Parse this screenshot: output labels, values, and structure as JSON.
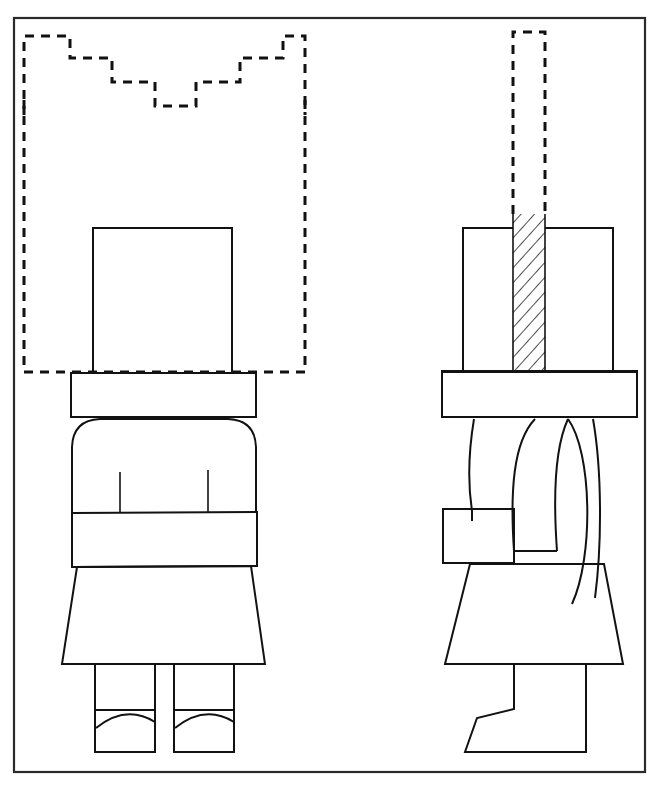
{
  "page": {
    "background_color": "#ffffff",
    "ink_color": "#121212",
    "caption_partial_top": "U.S. Patent",
    "width": 656,
    "height": 789
  },
  "frame": {
    "name": "drawing-border",
    "x": 14,
    "y": 18,
    "width": 631,
    "height": 754,
    "stroke": "#2a2a2a"
  },
  "figure": {
    "type": "line-drawing",
    "views": [
      {
        "id": "front-view",
        "label": "front elevation",
        "side": "left"
      },
      {
        "id": "side-view",
        "label": "side elevation",
        "side": "right"
      }
    ]
  },
  "front_view": {
    "name": "front-elevation",
    "crown_phantom": {
      "name": "crown-phantom-outline",
      "style": "dashed",
      "points": "24,115 24,36 70,36 70,58 112,58 112,82 155,82 155,106 196,106 196,82 240,82 240,58 283,58 283,36 305,36 305,115"
    },
    "crown_baseline": {
      "name": "crown-baseline",
      "style": "dashed",
      "x1": 24,
      "y1": 372,
      "x2": 305,
      "y2": 372
    },
    "crown_left_rail": {
      "x": 24,
      "y1": 100,
      "y2": 372
    },
    "crown_right_rail": {
      "x": 305,
      "y1": 100,
      "y2": 372
    },
    "head": {
      "name": "head-block",
      "x": 93,
      "y": 228,
      "width": 139,
      "height": 145
    },
    "brim": {
      "name": "hat-brim",
      "x": 71,
      "y": 373,
      "width": 185,
      "height": 44
    },
    "torso": {
      "name": "torso",
      "left": 72,
      "right": 256,
      "top": 420,
      "bottom": 512,
      "shoulder_radius": 26
    },
    "arm_line_left": {
      "x": 120,
      "y1": 472,
      "y2": 512
    },
    "arm_line_right": {
      "x": 208,
      "y1": 470,
      "y2": 512
    },
    "belt": {
      "name": "belt-band",
      "x": 72,
      "y": 512,
      "width": 185,
      "height": 54
    },
    "skirt": {
      "name": "skirt-trapezoid",
      "points": "77,566 251,566 265,664 62,664"
    },
    "leg_left": {
      "name": "leg-left",
      "x": 95,
      "y": 666,
      "width": 60,
      "height": 84
    },
    "leg_right": {
      "name": "leg-right",
      "x": 174,
      "y": 666,
      "width": 60,
      "height": 84
    },
    "shoe_line_left": {
      "x1": 95,
      "y1": 710,
      "x2": 155,
      "y2": 710
    },
    "shoe_line_right": {
      "x1": 174,
      "y1": 710,
      "x2": 234,
      "y2": 710
    },
    "shoe_arc_left": {
      "d": "M 96,726 Q 125,705 155,722"
    },
    "shoe_arc_right": {
      "d": "M 175,726 Q 204,705 234,722"
    }
  },
  "side_view": {
    "name": "side-elevation",
    "crown_phantom_rod": {
      "name": "crown-phantom-rod",
      "style": "dashed",
      "x": 513,
      "y": 32,
      "width": 32,
      "height": 182
    },
    "hatched_slot": {
      "name": "hatched-slot",
      "x": 513,
      "y": 214,
      "width": 32,
      "height": 158,
      "pattern": "diagonal-hatch"
    },
    "head_block_left": {
      "name": "head-block-rear",
      "x": 463,
      "y": 228,
      "width": 50,
      "height": 145
    },
    "head_block_right": {
      "name": "head-block-front",
      "x": 545,
      "y": 228,
      "width": 68,
      "height": 145
    },
    "brim": {
      "name": "hat-brim-side",
      "x": 442,
      "y": 371,
      "width": 195,
      "height": 46
    },
    "body_back": {
      "name": "body-back-edge",
      "d": "M 473,419 C 468,455 468,480 472,508 L 472,520"
    },
    "body_front": {
      "name": "body-front-edge",
      "d": "M 593,419 C 600,470 600,540 594,596"
    },
    "arm_profile": {
      "name": "arm-profile",
      "d": "M 535,419 C 512,440 509,490 514,551 L 556,551 C 551,495 554,445 568,419"
    },
    "arm_outer": {
      "name": "arm-outer-curve",
      "d": "M 568,419 C 590,450 592,560 570,604"
    },
    "belt_side": {
      "name": "belt-band-side",
      "points": "443,509 513,509 513,563 443,563"
    },
    "skirt_side": {
      "name": "skirt-side",
      "points": "470,564 604,564 623,664 445,664"
    },
    "boot": {
      "name": "boot-profile",
      "d": "M 514,665 L 514,709 L 476,718 L 465,752 L 586,752 L 586,665"
    }
  },
  "legend": {
    "dashed_meaning": "phantom line (alternate position)",
    "hatched_meaning": "section cut"
  }
}
